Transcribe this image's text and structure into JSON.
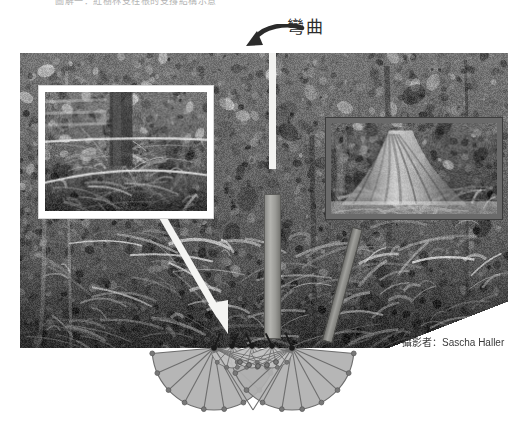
{
  "figure": {
    "top_caption_partial": "圖解一：紅樹林支柱根的支撐結構示意",
    "bend_annotation": "彎曲",
    "photo_credit": "攝影者：Sascha Haller",
    "credit_label": "攝影者",
    "credit_name": "Sascha Haller"
  },
  "annotations": [
    {
      "name": "bend-arrow",
      "icon": "curved-arrow-left-icon",
      "label": "彎曲"
    },
    {
      "name": "pointer-arrow",
      "icon": "arrow-down-right-icon",
      "label": ""
    }
  ],
  "insets": [
    {
      "name": "inset-left",
      "caption": "",
      "border": "#ffffff",
      "subject": "tree-root-closeup"
    },
    {
      "name": "inset-right",
      "caption": "",
      "border": "#3d3d3d",
      "subject": "buttress-root-tree"
    }
  ],
  "elements": {
    "trunk_label": "",
    "side_root_label": "",
    "top_line_label": ""
  },
  "colors": {
    "fan_fill": "#b0b0b0",
    "fan_fill_light": "#c2c2c2",
    "fan_stroke": "#6e6e6e",
    "node": "#787878",
    "node_dark": "#1a1a1a",
    "trunk": "#9a9a96",
    "arrow_white": "#f4f4f2",
    "text": "#2b2b2b"
  },
  "chart_data": {
    "type": "diagram",
    "anchors": [
      {
        "id": "A",
        "x": 214,
        "y": 348
      },
      {
        "id": "B",
        "x": 292,
        "y": 348
      }
    ],
    "inner_nodes": [
      {
        "id": "n1",
        "x": 232,
        "y": 346
      },
      {
        "id": "n2",
        "x": 252,
        "y": 346
      },
      {
        "id": "n3",
        "x": 272,
        "y": 346
      }
    ],
    "mid_nodes": [
      {
        "id": "m1",
        "x": 240,
        "y": 362
      },
      {
        "id": "m2",
        "x": 249,
        "y": 365
      },
      {
        "id": "m3",
        "x": 258,
        "y": 366
      },
      {
        "id": "m4",
        "x": 267,
        "y": 365
      },
      {
        "id": "m5",
        "x": 276,
        "y": 362
      }
    ],
    "fans": [
      {
        "center_x": 214,
        "center_y": 348,
        "radius": 62,
        "start_angle": 5,
        "end_angle": 175,
        "rays": 9
      },
      {
        "center_x": 292,
        "center_y": 348,
        "radius": 62,
        "start_angle": 5,
        "end_angle": 175,
        "rays": 9
      }
    ],
    "ground_line_y": 348,
    "xlabel": "",
    "ylabel": ""
  }
}
